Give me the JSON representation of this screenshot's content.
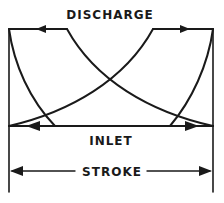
{
  "diagram": {
    "type": "pump indicator card (stroke vs pressure)",
    "labels": {
      "discharge": "DISCHARGE",
      "inlet": "INLET",
      "stroke": "STROKE"
    },
    "colors": {
      "ink": "#1a1a1a",
      "background": "#ffffff"
    },
    "arrows": {
      "discharge_left": "left",
      "discharge_right": "right",
      "inlet_left": "left",
      "inlet_right": "right",
      "stroke_dimension": "both"
    }
  }
}
